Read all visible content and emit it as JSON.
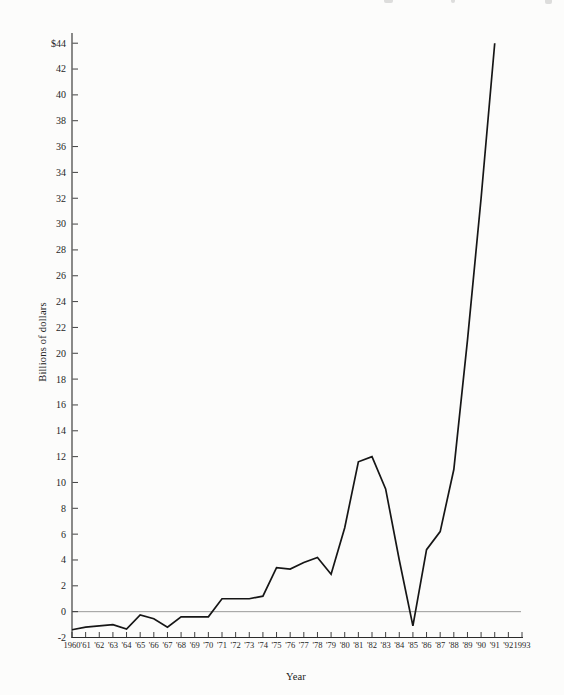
{
  "page": {
    "background": "#fcfcfb"
  },
  "chart_data": {
    "type": "line",
    "title": "",
    "xlabel": "Year",
    "ylabel": "Billions of dollars",
    "grid": false,
    "legend": false,
    "zero_line": true,
    "line_color": "#161616",
    "axis_color": "#2b2b2b",
    "zero_line_color": "#8f8f8f",
    "x_axis": {
      "min_year": 1960,
      "max_year": 1993,
      "tick_labels": [
        "1960",
        "'61",
        "'62",
        "'63",
        "'64",
        "'65",
        "'66",
        "'67",
        "'68",
        "'69",
        "'70",
        "'71",
        "'72",
        "'73",
        "'74",
        "'75",
        "'76",
        "'77",
        "'78",
        "'79",
        "'80",
        "'81",
        "'82",
        "'83",
        "'84",
        "'85",
        "'86",
        "'87",
        "'88",
        "'89",
        "'90",
        "'91",
        "'92",
        "1993"
      ]
    },
    "y_axis": {
      "min": -2,
      "max": 44,
      "tick_step": 2,
      "top_label": "$44",
      "tick_labels": [
        "$44",
        "42",
        "40",
        "38",
        "36",
        "34",
        "32",
        "30",
        "28",
        "26",
        "24",
        "22",
        "20",
        "18",
        "16",
        "14",
        "12",
        "10",
        "8",
        "6",
        "4",
        "2",
        "0",
        "-2"
      ]
    },
    "series": [
      {
        "name": "Billions of dollars",
        "years": [
          1960,
          1961,
          1962,
          1963,
          1964,
          1965,
          1966,
          1967,
          1968,
          1969,
          1970,
          1971,
          1972,
          1973,
          1974,
          1975,
          1976,
          1977,
          1978,
          1979,
          1980,
          1981,
          1982,
          1983,
          1984,
          1985,
          1986,
          1987,
          1988,
          1989,
          1990,
          1991
        ],
        "values": [
          -1.4,
          -1.2,
          -1.1,
          -1.0,
          -1.35,
          -0.25,
          -0.55,
          -1.2,
          -0.4,
          -0.4,
          -0.4,
          1.0,
          1.0,
          1.0,
          1.2,
          3.4,
          3.3,
          3.8,
          4.2,
          2.9,
          6.5,
          11.6,
          12.0,
          9.5,
          4.0,
          -1.1,
          4.8,
          6.2,
          11.0,
          21.0,
          32.0,
          44.0
        ]
      }
    ]
  }
}
